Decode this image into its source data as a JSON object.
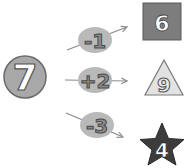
{
  "start": {
    "value": "7",
    "shape": "circle"
  },
  "operations": [
    {
      "label": "-1",
      "result": "6",
      "result_shape": "square"
    },
    {
      "label": "+2",
      "result": "9",
      "result_shape": "triangle"
    },
    {
      "label": "-3",
      "result": "4",
      "result_shape": "star"
    }
  ],
  "colors": {
    "circle_fill": "#a8a8a8",
    "oval_fill": "#b9b9b9",
    "square_fill": "#7d7d7d",
    "triangle_fill": "#e2e2e2",
    "star_fill": "#3c3c3c",
    "arrow": "#8a8a8a"
  }
}
